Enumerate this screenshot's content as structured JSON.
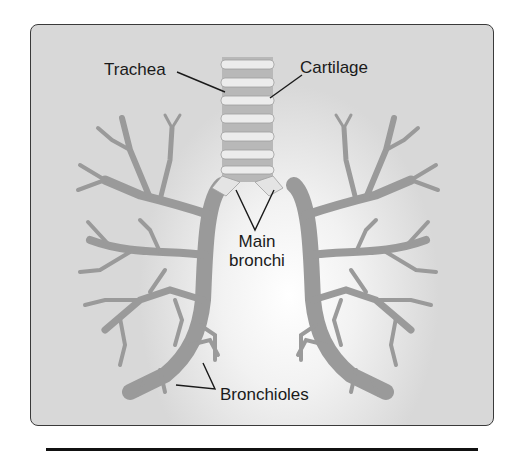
{
  "diagram": {
    "labels": {
      "trachea": "Trachea",
      "cartilage": "Cartilage",
      "main_bronchi_line1": "Main",
      "main_bronchi_line2": "bronchi",
      "bronchioles": "Bronchioles"
    },
    "colors": {
      "frame_border": "#3a3a3a",
      "background_edge": "#d8d8d8",
      "background_center": "#ffffff",
      "airway": "#9a9a9a",
      "cartilage_ring": "#e8e8e8",
      "leader_line": "#1a1a1a"
    }
  }
}
